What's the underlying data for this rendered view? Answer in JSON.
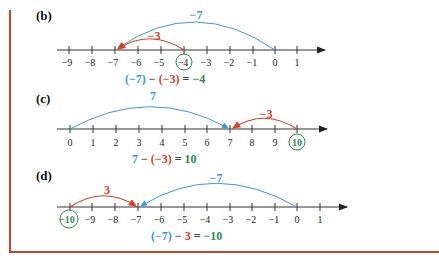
{
  "colors": {
    "frame": "#c8432a",
    "blue": "#3a9ad0",
    "red": "#d8402a",
    "green": "#2e8a4e",
    "axis": "#333333"
  },
  "panels": [
    {
      "label": "(b)",
      "ticks": [
        "−9",
        "−8",
        "−7",
        "−6",
        "−5",
        "−4",
        "−3",
        "−2",
        "−1",
        "0",
        "1"
      ],
      "circled": "−4",
      "blue_jump": "−7",
      "red_jump": "−3",
      "equation": {
        "p1": "(−7)",
        "op": " − ",
        "p2": "(−3)",
        "eq": " = ",
        "result": "−4"
      }
    },
    {
      "label": "(c)",
      "ticks": [
        "0",
        "1",
        "2",
        "3",
        "4",
        "5",
        "6",
        "7",
        "8",
        "9",
        "10"
      ],
      "circled": "10",
      "blue_jump": "7",
      "red_jump": "−3",
      "equation": {
        "p1": "7",
        "op": " − ",
        "p2": "(−3)",
        "eq": " = ",
        "result": "10"
      }
    },
    {
      "label": "(d)",
      "ticks": [
        "−10",
        "−9",
        "−8",
        "−7",
        "−6",
        "−5",
        "−4",
        "−3",
        "−2",
        "−1",
        "0",
        "1"
      ],
      "circled": "−10",
      "blue_jump": "−7",
      "red_jump": "3",
      "equation": {
        "p1": "(−7)",
        "op": " − ",
        "p2": "3",
        "eq": " = ",
        "result": "−10"
      }
    }
  ]
}
